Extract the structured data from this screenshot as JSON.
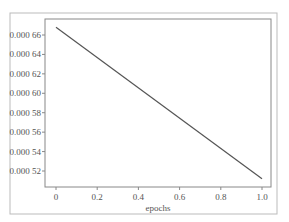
{
  "chart_data": {
    "type": "line",
    "title": "",
    "xlabel": "epochs",
    "ylabel": "",
    "xlim": [
      -0.05,
      1.05
    ],
    "ylim": [
      0.000503,
      0.000677
    ],
    "x_ticks": [
      0,
      0.2,
      0.4,
      0.6,
      0.8,
      1.0
    ],
    "x_tick_labels": [
      "0",
      "0.2",
      "0.4",
      "0.6",
      "0.8",
      "1.0"
    ],
    "y_ticks": [
      0.00052,
      0.00054,
      0.00056,
      0.00058,
      0.0006,
      0.00062,
      0.00064,
      0.00066
    ],
    "y_tick_labels": [
      "0.000 52",
      "0.000 54",
      "0.000 56",
      "0.000 58",
      "0.000 60",
      "0.000 62",
      "0.000 64",
      "0.000 66"
    ],
    "grid": false,
    "legend": null,
    "series": [
      {
        "name": "loss",
        "x": [
          0,
          1.0
        ],
        "y": [
          0.000668,
          0.000512
        ],
        "color": "#555555"
      }
    ]
  },
  "colors": {
    "frame": "#bbbbbb",
    "axes": "#888888",
    "line": "#555555",
    "text": "#555555"
  }
}
